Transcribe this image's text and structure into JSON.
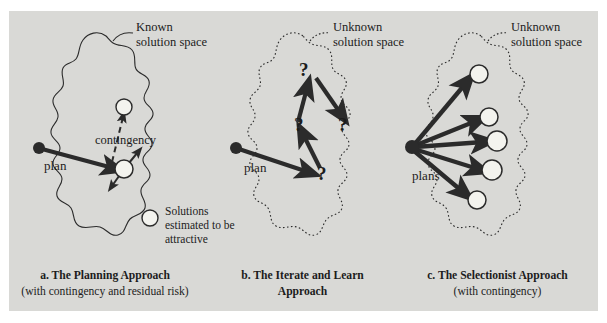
{
  "figure": {
    "background_color": "#d9d9d6",
    "page_color": "#ffffff",
    "ink_color": "#2b2b2b"
  },
  "panels": [
    {
      "id": "a",
      "space_label_line1": "Known",
      "space_label_line2": "solution space",
      "outline_style": "solid",
      "origin_label": "plan",
      "contingency_label": "contingency",
      "legend": {
        "line1": "Solutions",
        "line2": "estimated to be",
        "line3": "attractive"
      },
      "caption_title": "a. The Planning Approach",
      "caption_sub": "(with contingency and residual risk)",
      "solutions": [
        {
          "cx": 124,
          "cy": 107,
          "r": 8
        },
        {
          "cx": 124,
          "cy": 169,
          "r": 9
        }
      ],
      "origin": {
        "cx": 39,
        "cy": 148,
        "r": 6
      }
    },
    {
      "id": "b",
      "space_label_line1": "Unknown",
      "space_label_line2": "solution space",
      "outline_style": "dotted",
      "origin_label": "plan",
      "caption_title": "b. The Iterate and Learn",
      "caption_sub": "Approach",
      "question_marks": [
        {
          "x": 317,
          "y": 176,
          "label": "?"
        },
        {
          "x": 297,
          "y": 127,
          "label": "?"
        },
        {
          "x": 302,
          "y": 72,
          "label": "?"
        },
        {
          "x": 341,
          "y": 127,
          "label": "?"
        }
      ],
      "origin": {
        "cx": 236,
        "cy": 148,
        "r": 6
      }
    },
    {
      "id": "c",
      "space_label_line1": "Unknown",
      "space_label_line2": "solution space",
      "outline_style": "dotted",
      "origin_label": "plans",
      "caption_title": "c. The Selectionist Approach",
      "caption_sub": "(with contingency)",
      "solutions": [
        {
          "cx": 479,
          "cy": 74,
          "r": 9
        },
        {
          "cx": 489,
          "cy": 117,
          "r": 9
        },
        {
          "cx": 497,
          "cy": 141,
          "r": 10
        },
        {
          "cx": 492,
          "cy": 170,
          "r": 10
        },
        {
          "cx": 477,
          "cy": 200,
          "r": 9
        }
      ],
      "origin": {
        "cx": 412,
        "cy": 147,
        "r": 7
      }
    }
  ]
}
